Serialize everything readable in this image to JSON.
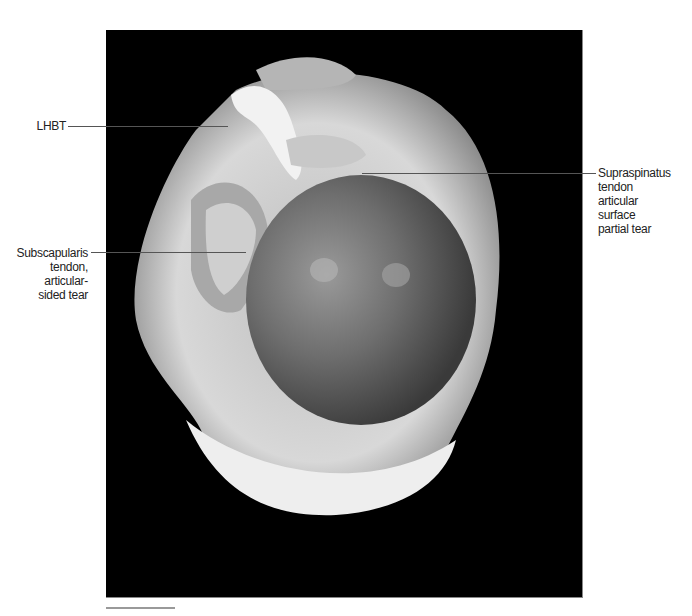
{
  "figure": {
    "labels": {
      "lhbt": "LHBT",
      "subscapularis": [
        "Subscapularis",
        "tendon,",
        "articular-",
        "sided tear"
      ],
      "supraspinatus": [
        "Supraspinatus",
        "tendon",
        "articular",
        "surface",
        "partial tear"
      ]
    }
  }
}
